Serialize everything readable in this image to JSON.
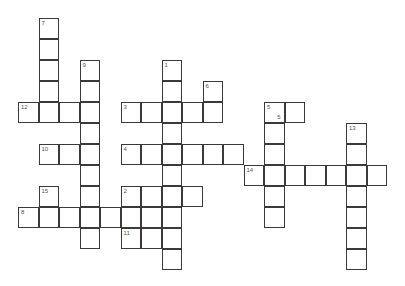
{
  "puzzle": {
    "type": "crossword",
    "cell_size": [
      20.5,
      21
    ],
    "origin": [
      18,
      18
    ],
    "cells": [
      {
        "r": 0,
        "c": 1,
        "n": "7"
      },
      {
        "r": 1,
        "c": 1
      },
      {
        "r": 2,
        "c": 1
      },
      {
        "r": 3,
        "c": 1
      },
      {
        "r": 4,
        "c": 1
      },
      {
        "r": 2,
        "c": 3,
        "n": "9"
      },
      {
        "r": 3,
        "c": 3
      },
      {
        "r": 4,
        "c": 3
      },
      {
        "r": 5,
        "c": 3
      },
      {
        "r": 6,
        "c": 3
      },
      {
        "r": 7,
        "c": 3
      },
      {
        "r": 8,
        "c": 3
      },
      {
        "r": 9,
        "c": 3
      },
      {
        "r": 10,
        "c": 3
      },
      {
        "r": 4,
        "c": 0,
        "n": "12"
      },
      {
        "r": 4,
        "c": 2
      },
      {
        "r": 6,
        "c": 1,
        "n": "10"
      },
      {
        "r": 6,
        "c": 2
      },
      {
        "r": 8,
        "c": 1,
        "n": "15"
      },
      {
        "r": 9,
        "c": 1
      },
      {
        "r": 9,
        "c": 0,
        "n": "8"
      },
      {
        "r": 9,
        "c": 2
      },
      {
        "r": 9,
        "c": 4
      },
      {
        "r": 9,
        "c": 5
      },
      {
        "r": 9,
        "c": 6
      },
      {
        "r": 2,
        "c": 7,
        "n": "1"
      },
      {
        "r": 3,
        "c": 7
      },
      {
        "r": 4,
        "c": 7
      },
      {
        "r": 5,
        "c": 7
      },
      {
        "r": 6,
        "c": 7
      },
      {
        "r": 7,
        "c": 7
      },
      {
        "r": 8,
        "c": 7
      },
      {
        "r": 9,
        "c": 7
      },
      {
        "r": 10,
        "c": 7
      },
      {
        "r": 11,
        "c": 7
      },
      {
        "r": 4,
        "c": 5,
        "n": "3"
      },
      {
        "r": 4,
        "c": 6
      },
      {
        "r": 4,
        "c": 8
      },
      {
        "r": 4,
        "c": 9
      },
      {
        "r": 3,
        "c": 9,
        "n": "6"
      },
      {
        "r": 6,
        "c": 5,
        "n": "4"
      },
      {
        "r": 6,
        "c": 6
      },
      {
        "r": 6,
        "c": 8
      },
      {
        "r": 6,
        "c": 9
      },
      {
        "r": 6,
        "c": 10
      },
      {
        "r": 8,
        "c": 5,
        "n": "2"
      },
      {
        "r": 8,
        "c": 6
      },
      {
        "r": 8,
        "c": 8
      },
      {
        "r": 10,
        "c": 5,
        "n": "11"
      },
      {
        "r": 10,
        "c": 6
      },
      {
        "r": 4,
        "c": 12,
        "n": "5",
        "n2": "5"
      },
      {
        "r": 4,
        "c": 13
      },
      {
        "r": 5,
        "c": 12
      },
      {
        "r": 6,
        "c": 12
      },
      {
        "r": 7,
        "c": 12
      },
      {
        "r": 8,
        "c": 12
      },
      {
        "r": 9,
        "c": 12
      },
      {
        "r": 7,
        "c": 11,
        "n": "14"
      },
      {
        "r": 7,
        "c": 13
      },
      {
        "r": 7,
        "c": 14
      },
      {
        "r": 7,
        "c": 15
      },
      {
        "r": 7,
        "c": 16
      },
      {
        "r": 7,
        "c": 17
      },
      {
        "r": 5,
        "c": 16,
        "n": "13"
      },
      {
        "r": 6,
        "c": 16
      },
      {
        "r": 8,
        "c": 16
      },
      {
        "r": 9,
        "c": 16
      },
      {
        "r": 10,
        "c": 16
      },
      {
        "r": 11,
        "c": 16
      }
    ]
  }
}
